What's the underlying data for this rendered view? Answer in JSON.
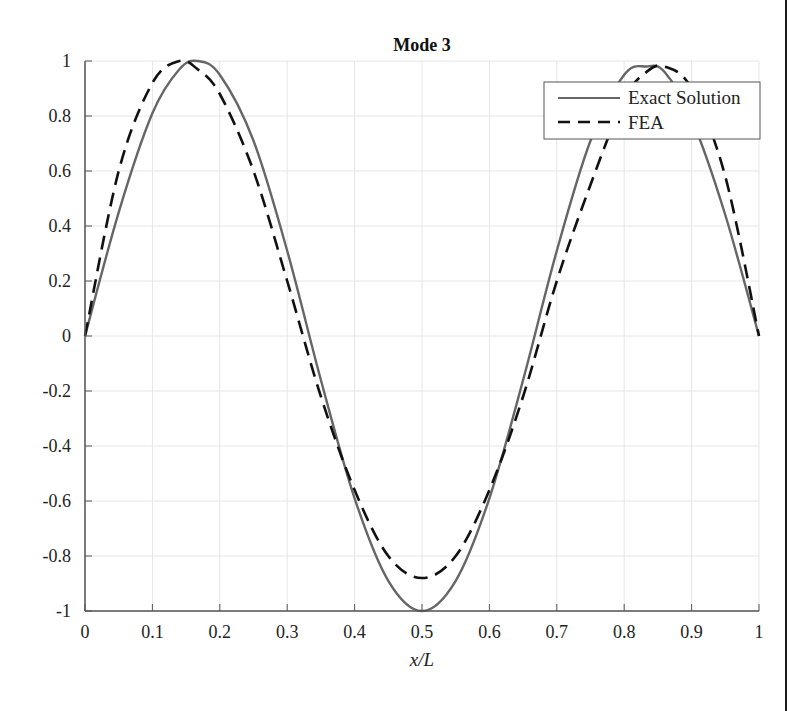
{
  "chart_data": {
    "type": "line",
    "title": "Mode 3",
    "xlabel": "x/L",
    "ylabel": "",
    "xlim": [
      0,
      1
    ],
    "ylim": [
      -1,
      1
    ],
    "grid": true,
    "legend_position": "upper right",
    "x_ticks": [
      "0",
      "0.1",
      "0.2",
      "0.3",
      "0.4",
      "0.5",
      "0.6",
      "0.7",
      "0.8",
      "0.9",
      "1"
    ],
    "y_ticks": [
      "1",
      "0.8",
      "0.6",
      "0.4",
      "0.2",
      "0",
      "-0.2",
      "-0.4",
      "-0.6",
      "-0.8",
      "-1"
    ],
    "x": [
      0,
      0.05,
      0.1,
      0.14,
      0.167,
      0.2,
      0.25,
      0.3,
      0.35,
      0.4,
      0.45,
      0.5,
      0.55,
      0.6,
      0.65,
      0.7,
      0.75,
      0.8,
      0.833,
      0.86,
      0.9,
      0.95,
      1
    ],
    "series": [
      {
        "name": "Exact Solution",
        "style": "solid",
        "color": "#666666",
        "values": [
          0,
          0.45,
          0.81,
          0.97,
          1.0,
          0.95,
          0.71,
          0.31,
          -0.16,
          -0.59,
          -0.89,
          -1.0,
          -0.89,
          -0.59,
          -0.16,
          0.31,
          0.71,
          0.95,
          0.98,
          0.96,
          0.79,
          0.44,
          0
        ]
      },
      {
        "name": "FEA",
        "style": "dashed",
        "color": "#111111",
        "values": [
          0,
          0.6,
          0.92,
          1.0,
          0.97,
          0.88,
          0.6,
          0.2,
          -0.22,
          -0.56,
          -0.8,
          -0.88,
          -0.8,
          -0.56,
          -0.22,
          0.2,
          0.55,
          0.86,
          0.96,
          0.98,
          0.9,
          0.58,
          0
        ]
      }
    ]
  },
  "legend": {
    "items": [
      {
        "label": "Exact Solution"
      },
      {
        "label": "FEA"
      }
    ]
  },
  "colors": {
    "axis": "#555555",
    "grid": "#e6e6e6",
    "exact": "#666666",
    "fea": "#111111"
  }
}
